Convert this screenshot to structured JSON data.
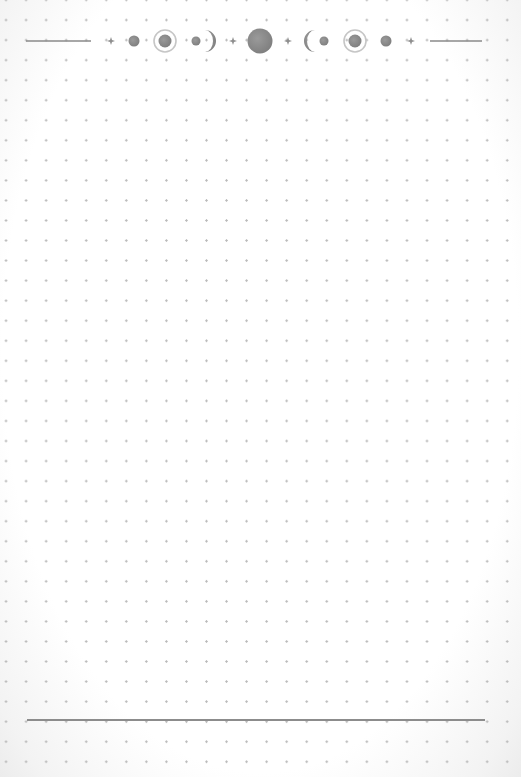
{
  "page": {
    "type": "dot-grid-notebook-page",
    "grid_spacing_px": 20,
    "colors": {
      "paper": "#ffffff",
      "dot": "#b9b9b9",
      "rule": "#8c8c8c",
      "moon_fill": "#8e8e8e",
      "moon_ring": "#c8c8c8"
    }
  },
  "header": {
    "decoration": "moon-phases-border",
    "elements": [
      "line",
      "sparkle",
      "moon-dot",
      "ringed-moon",
      "waxing-crescent-with-dot",
      "sparkle",
      "full-moon",
      "sparkle",
      "waning-crescent-with-dot",
      "ringed-moon",
      "moon-dot",
      "sparkle",
      "line"
    ]
  },
  "footer": {
    "decoration": "horizontal-rule"
  }
}
